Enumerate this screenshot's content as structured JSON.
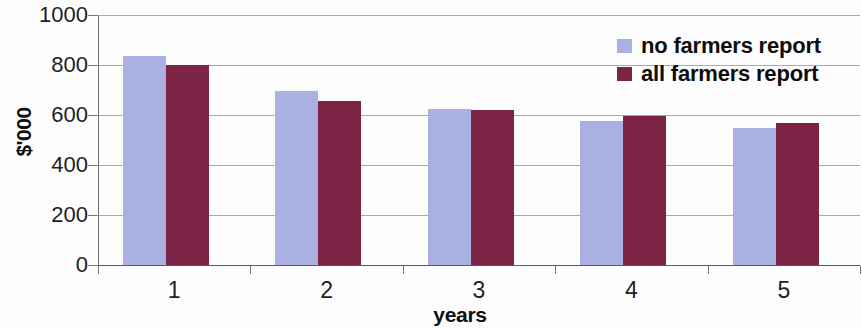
{
  "chart_data": {
    "type": "bar",
    "title": "",
    "subtitle": "",
    "xlabel": "years",
    "ylabel": "$'000",
    "categories": [
      "1",
      "2",
      "3",
      "4",
      "5"
    ],
    "series": [
      {
        "name": "no farmers report",
        "color": "#aab0e2",
        "values": [
          838,
          697,
          625,
          575,
          548
        ]
      },
      {
        "name": "all farmers report",
        "color": "#7c2445",
        "values": [
          800,
          658,
          622,
          598,
          568
        ]
      }
    ],
    "ylim": [
      0,
      1000
    ],
    "yticks": [
      0,
      200,
      400,
      600,
      800,
      1000
    ],
    "ytick_labels": [
      "0",
      "200",
      "400",
      "600",
      "800",
      "1000"
    ],
    "grid": true,
    "grid_axis": "y",
    "legend_position": "top-right",
    "bar_border": "none",
    "annotations": []
  },
  "legend": {
    "items": [
      {
        "label": "no farmers report",
        "swatch": "#aab0e2"
      },
      {
        "label": "all farmers report",
        "swatch": "#7c2445"
      }
    ]
  },
  "axes": {
    "y_title": "$'000",
    "x_title": "years"
  },
  "colors": {
    "series_no_farmers": "#aab0e2",
    "series_all_farmers": "#7c2445",
    "gridline": "#9a9a9a",
    "axis": "#5a5a5a",
    "text": "#1a1a1a",
    "background": "#fdfdfd"
  }
}
